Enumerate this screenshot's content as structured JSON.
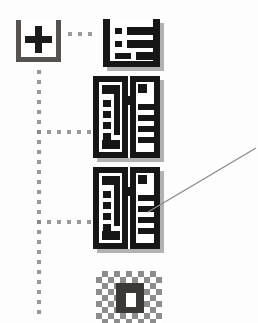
{
  "canvas": {
    "width": 258,
    "height": 323,
    "background": "#fdfdfd",
    "description": "Scanned low-resolution screenshot fragment of a hierarchical icon tree with a callout pointer line"
  },
  "colors": {
    "background": "#fdfdfd",
    "ink_black": "#161616",
    "node_border_gray": "#55524f",
    "dotted_connector_gray": "#9a9a9a",
    "icon_shadow_gray": "#b4b2b0",
    "dither_gray": "#8e8c8a",
    "callout_line_gray": "#8b8b8b"
  },
  "tree": {
    "root": {
      "name": "expand-node",
      "icon": "plus-in-open-box-icon",
      "glyph": "+",
      "state": "expanded",
      "position": {
        "x": 16,
        "y": 20,
        "w": 45,
        "h": 42
      }
    },
    "connectors": [
      {
        "name": "root-to-list-connector",
        "style": "dotted",
        "orientation": "horizontal",
        "color": "#9a9a9a",
        "from": {
          "x": 66,
          "y": 34
        },
        "to": {
          "x": 98,
          "y": 34
        },
        "dot_count": 3
      },
      {
        "name": "trunk-connector",
        "style": "dotted",
        "orientation": "vertical",
        "color": "#9a9a9a",
        "from": {
          "x": 39,
          "y": 68
        },
        "to": {
          "x": 39,
          "y": 312
        }
      },
      {
        "name": "branch-connector-1",
        "style": "dotted",
        "orientation": "horizontal",
        "color": "#9a9a9a",
        "from": {
          "x": 39,
          "y": 132
        },
        "to": {
          "x": 93,
          "y": 132
        }
      },
      {
        "name": "branch-connector-2",
        "style": "dotted",
        "orientation": "horizontal",
        "color": "#9a9a9a",
        "from": {
          "x": 39,
          "y": 222
        },
        "to": {
          "x": 93,
          "y": 222
        }
      }
    ],
    "children": [
      {
        "name": "list-form-icon",
        "icon": "list-form-icon",
        "rows": 3,
        "row_bullets": [
          "small",
          "small",
          "wide"
        ],
        "position": {
          "x": 103,
          "y": 19,
          "w": 57,
          "h": 48
        },
        "state": "enabled"
      },
      {
        "name": "record-pair-icon-1",
        "icon": "dual-pane-record-icon",
        "panes": 2,
        "left_pane_squares": 4,
        "right_pane_lines": 4,
        "position": {
          "x": 93,
          "y": 76,
          "w": 67,
          "h": 82
        },
        "state": "enabled"
      },
      {
        "name": "record-pair-icon-2",
        "icon": "dual-pane-record-icon",
        "panes": 2,
        "left_pane_squares": 4,
        "right_pane_lines": 4,
        "position": {
          "x": 93,
          "y": 167,
          "w": 67,
          "h": 82
        },
        "state": "enabled",
        "annotated": true
      },
      {
        "name": "dithered-icon",
        "icon": "dithered-disabled-icon",
        "position": {
          "x": 96,
          "y": 271,
          "w": 66,
          "h": 52
        },
        "state": "disabled",
        "clipped_by_frame_edge": true
      }
    ]
  },
  "callout": {
    "name": "callout-pointer-line",
    "color": "#8b8b8b",
    "from": {
      "x": 256,
      "y": 148
    },
    "to": {
      "x": 148,
      "y": 212
    },
    "target": "record-pair-icon-2",
    "label": ""
  }
}
